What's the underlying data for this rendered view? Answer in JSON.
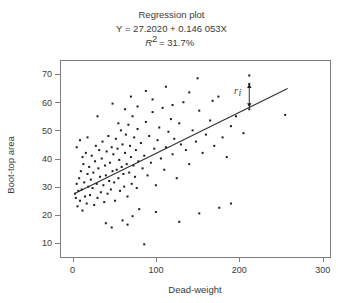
{
  "chart_data": {
    "type": "scatter",
    "title": "Regression plot",
    "equation": "Y = 27.2020 + 0.146 053X",
    "r_squared_text": "R² = 31.7%",
    "r_squared_prefix": "R",
    "r_squared_exponent": "2",
    "r_squared_value": "= 31.7%",
    "xlabel": "Dead-weight",
    "ylabel": "Boot-top area",
    "xlim": [
      -15,
      310
    ],
    "ylim": [
      5,
      75
    ],
    "xticks": [
      0,
      100,
      200,
      300
    ],
    "yticks": [
      10,
      20,
      30,
      40,
      50,
      60,
      70
    ],
    "xtick_labels": [
      "0",
      "100",
      "200",
      "300"
    ],
    "ytick_labels": [
      "10",
      "20",
      "30",
      "40",
      "50",
      "60",
      "70"
    ],
    "grid": false,
    "legend": "none",
    "fit": {
      "intercept": 27.202,
      "slope": 0.146053,
      "x_start": 2,
      "x_end": 258
    },
    "annotation": {
      "label": "r",
      "subscript": "i",
      "x": 212,
      "y_point": 66.5,
      "y_line": 58.2,
      "label_x": 196,
      "label_y": 63
    },
    "marker_size": 2.0,
    "marker_color": "#1c1c1c",
    "points": [
      [
        3,
        27.5
      ],
      [
        4,
        26.0
      ],
      [
        5,
        31.0
      ],
      [
        6,
        23.0
      ],
      [
        7,
        28.5
      ],
      [
        8,
        33.0
      ],
      [
        9,
        25.0
      ],
      [
        10,
        35.5
      ],
      [
        11,
        29.0
      ],
      [
        12,
        21.5
      ],
      [
        13,
        38.0
      ],
      [
        14,
        31.5
      ],
      [
        15,
        26.5
      ],
      [
        16,
        42.0
      ],
      [
        17,
        24.0
      ],
      [
        5,
        44.0
      ],
      [
        9,
        46.5
      ],
      [
        12,
        40.5
      ],
      [
        18,
        34.5
      ],
      [
        19,
        30.0
      ],
      [
        20,
        37.0
      ],
      [
        21,
        27.0
      ],
      [
        22,
        32.5
      ],
      [
        23,
        41.0
      ],
      [
        24,
        29.5
      ],
      [
        25,
        35.0
      ],
      [
        26,
        23.5
      ],
      [
        27,
        39.0
      ],
      [
        28,
        44.5
      ],
      [
        29,
        31.0
      ],
      [
        30,
        26.0
      ],
      [
        31,
        36.5
      ],
      [
        32,
        43.0
      ],
      [
        33,
        33.5
      ],
      [
        34,
        28.0
      ],
      [
        35,
        40.0
      ],
      [
        36,
        46.0
      ],
      [
        37,
        30.5
      ],
      [
        38,
        24.5
      ],
      [
        39,
        37.5
      ],
      [
        40,
        34.0
      ],
      [
        41,
        42.5
      ],
      [
        42,
        27.5
      ],
      [
        43,
        48.0
      ],
      [
        44,
        32.0
      ],
      [
        45,
        38.5
      ],
      [
        46,
        29.0
      ],
      [
        47,
        44.0
      ],
      [
        48,
        35.5
      ],
      [
        49,
        41.5
      ],
      [
        50,
        31.5
      ],
      [
        51,
        25.0
      ],
      [
        52,
        47.0
      ],
      [
        53,
        36.0
      ],
      [
        54,
        43.5
      ],
      [
        55,
        33.0
      ],
      [
        56,
        39.5
      ],
      [
        57,
        28.5
      ],
      [
        58,
        50.0
      ],
      [
        59,
        37.0
      ],
      [
        60,
        45.0
      ],
      [
        61,
        34.5
      ],
      [
        62,
        30.0
      ],
      [
        63,
        42.0
      ],
      [
        64,
        48.5
      ],
      [
        65,
        38.0
      ],
      [
        66,
        26.5
      ],
      [
        67,
        52.0
      ],
      [
        68,
        35.0
      ],
      [
        69,
        44.5
      ],
      [
        70,
        40.5
      ],
      [
        71,
        31.0
      ],
      [
        72,
        55.0
      ],
      [
        73,
        37.5
      ],
      [
        74,
        47.5
      ],
      [
        75,
        33.5
      ],
      [
        76,
        43.0
      ],
      [
        77,
        29.5
      ],
      [
        78,
        50.5
      ],
      [
        79,
        39.0
      ],
      [
        80,
        22.0
      ],
      [
        82,
        45.5
      ],
      [
        84,
        36.5
      ],
      [
        86,
        41.0
      ],
      [
        88,
        53.0
      ],
      [
        90,
        34.0
      ],
      [
        92,
        48.0
      ],
      [
        94,
        38.5
      ],
      [
        96,
        56.5
      ],
      [
        98,
        43.5
      ],
      [
        100,
        30.5
      ],
      [
        102,
        46.5
      ],
      [
        104,
        51.0
      ],
      [
        106,
        40.0
      ],
      [
        108,
        58.0
      ],
      [
        110,
        36.0
      ],
      [
        112,
        44.0
      ],
      [
        115,
        49.5
      ],
      [
        118,
        54.0
      ],
      [
        120,
        41.5
      ],
      [
        122,
        47.0
      ],
      [
        125,
        33.0
      ],
      [
        128,
        52.5
      ],
      [
        130,
        45.0
      ],
      [
        133,
        60.0
      ],
      [
        136,
        43.0
      ],
      [
        140,
        38.0
      ],
      [
        144,
        50.0
      ],
      [
        148,
        46.0
      ],
      [
        152,
        57.0
      ],
      [
        156,
        42.0
      ],
      [
        160,
        48.5
      ],
      [
        165,
        53.5
      ],
      [
        170,
        44.5
      ],
      [
        175,
        62.0
      ],
      [
        180,
        47.5
      ],
      [
        185,
        40.5
      ],
      [
        190,
        51.5
      ],
      [
        196,
        55.0
      ],
      [
        205,
        49.0
      ],
      [
        212,
        57.5
      ],
      [
        212,
        66.5
      ],
      [
        212,
        69.5
      ],
      [
        255,
        55.5
      ],
      [
        86,
        9.5
      ],
      [
        40,
        17.0
      ],
      [
        47,
        15.5
      ],
      [
        60,
        18.0
      ],
      [
        66,
        16.5
      ],
      [
        72,
        19.5
      ],
      [
        100,
        21.0
      ],
      [
        128,
        17.5
      ],
      [
        152,
        20.5
      ],
      [
        176,
        22.5
      ],
      [
        190,
        24.0
      ],
      [
        18,
        47.5
      ],
      [
        30,
        55.0
      ],
      [
        48,
        59.5
      ],
      [
        55,
        52.5
      ],
      [
        63,
        57.5
      ],
      [
        70,
        62.0
      ],
      [
        78,
        58.5
      ],
      [
        88,
        64.0
      ],
      [
        96,
        61.0
      ],
      [
        112,
        65.5
      ],
      [
        120,
        59.0
      ],
      [
        140,
        63.5
      ],
      [
        150,
        68.5
      ],
      [
        168,
        60.5
      ]
    ]
  },
  "plot_geometry": {
    "frame_left": 60,
    "frame_right": 331,
    "frame_top": 60,
    "frame_bottom": 257,
    "x_pixels_per_unit": 0.9,
    "y_pixels_per_unit": 2.6
  }
}
